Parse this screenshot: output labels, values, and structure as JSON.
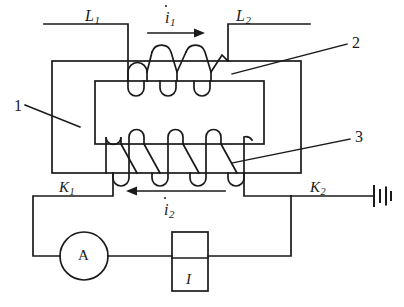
{
  "diagram": {
    "stroke_color": "#1a1a1a",
    "background_color": "#ffffff"
  },
  "labels": {
    "primary_terminal_left": {
      "text": "L",
      "sub": "1",
      "x": 85,
      "y": 8,
      "size": 16
    },
    "primary_terminal_right": {
      "text": "L",
      "sub": "2",
      "x": 236,
      "y": 8,
      "size": 16
    },
    "primary_current": {
      "text": "i",
      "sub": "1",
      "x": 165,
      "y": 10,
      "size": 16
    },
    "secondary_current": {
      "text": "i",
      "sub": "2",
      "x": 164,
      "y": 202,
      "size": 16
    },
    "switch_left": {
      "text": "K",
      "sub": "1",
      "x": 59,
      "y": 180,
      "size": 15
    },
    "switch_right": {
      "text": "K",
      "sub": "2",
      "x": 310,
      "y": 180,
      "size": 15
    },
    "ammeter": {
      "text": "A",
      "x": 78,
      "y": 248,
      "size": 15
    },
    "current_source": {
      "text": "I",
      "x": 186,
      "y": 272,
      "size": 15
    }
  },
  "callouts": {
    "core": {
      "text": "1",
      "x": 14,
      "y": 98,
      "size": 16
    },
    "primary_coil": {
      "text": "2",
      "x": 352,
      "y": 35,
      "size": 16
    },
    "secondary_coil": {
      "text": "3",
      "x": 355,
      "y": 129,
      "size": 16
    }
  },
  "components": {
    "outer_core": {
      "x": 52,
      "y": 61,
      "width": 249,
      "height": 112
    },
    "inner_window": {
      "x": 95,
      "y": 81,
      "width": 169,
      "height": 63
    },
    "ammeter_circle": {
      "cx": 84,
      "cy": 256,
      "r": 24
    },
    "source_box": {
      "x": 172,
      "y": 232,
      "width": 36,
      "height": 59
    },
    "battery": {
      "x": 374,
      "y": 195
    }
  }
}
